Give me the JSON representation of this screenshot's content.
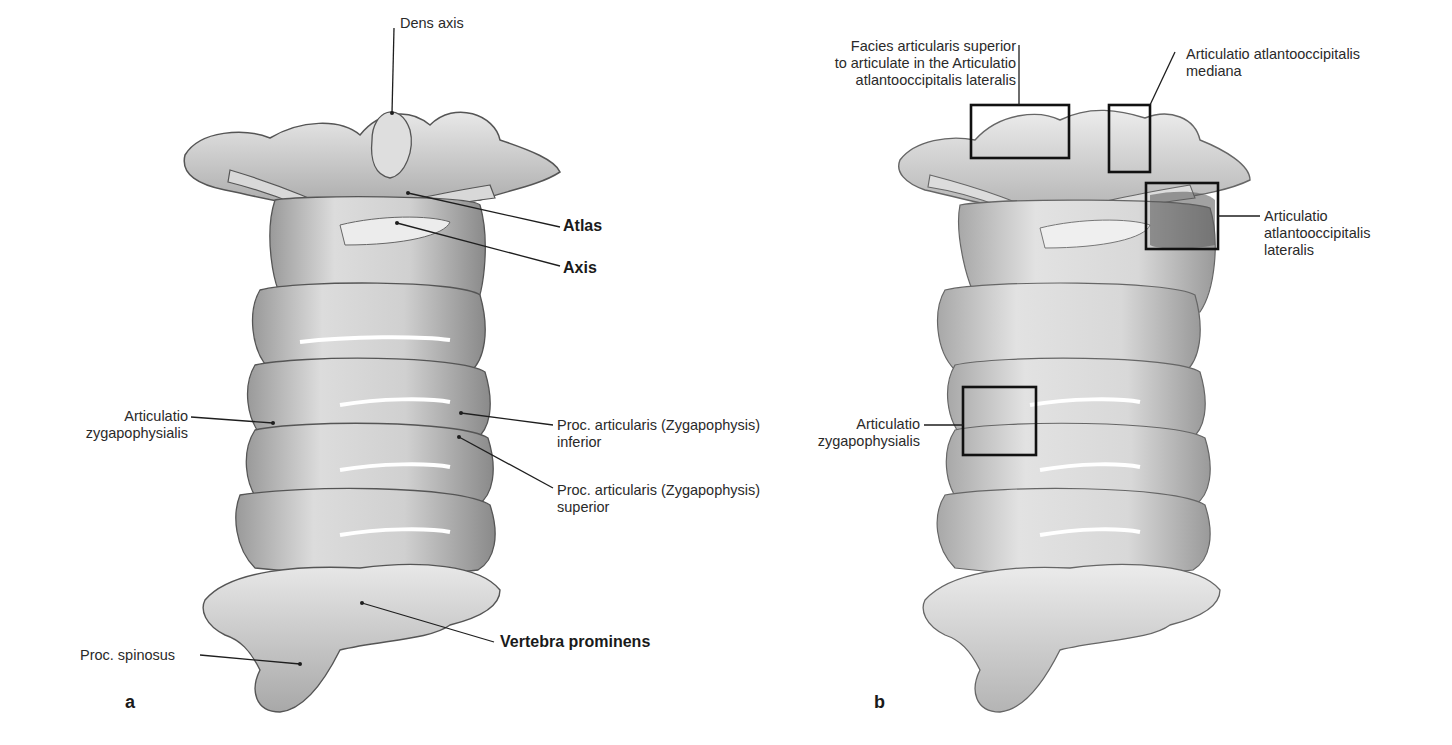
{
  "figure": {
    "panels": [
      {
        "id": "a",
        "letter": "a",
        "labels": {
          "dens_axis": "Dens axis",
          "atlas": "Atlas",
          "axis": "Axis",
          "art_zyg_1": "Articulatio",
          "art_zyg_2": "zygapophysialis",
          "proc_inf_1": "Proc. articularis (Zygapophysis)",
          "proc_inf_2": "inferior",
          "proc_sup_1": "Proc. articularis (Zygapophysis)",
          "proc_sup_2": "superior",
          "vertebra_prominens": "Vertebra prominens",
          "proc_spinosus": "Proc. spinosus"
        }
      },
      {
        "id": "b",
        "letter": "b",
        "labels": {
          "facies_1": "Facies articularis superior",
          "facies_2": "to articulate in the Articulatio",
          "facies_3": "atlantooccipitalis lateralis",
          "mediana_1": "Articulatio atlantooccipitalis",
          "mediana_2": "mediana",
          "lateralis_1": "Articulatio",
          "lateralis_2": "atlantooccipitalis",
          "lateralis_3": "lateralis",
          "zyg_1": "Articulatio",
          "zyg_2": "zygapophysialis"
        }
      }
    ],
    "colors": {
      "bone_light": "#e6e6e6",
      "bone_mid": "#c4c4c4",
      "bone_dark": "#6e6e6e",
      "line": "#1e1e1e",
      "background": "#ffffff"
    }
  }
}
